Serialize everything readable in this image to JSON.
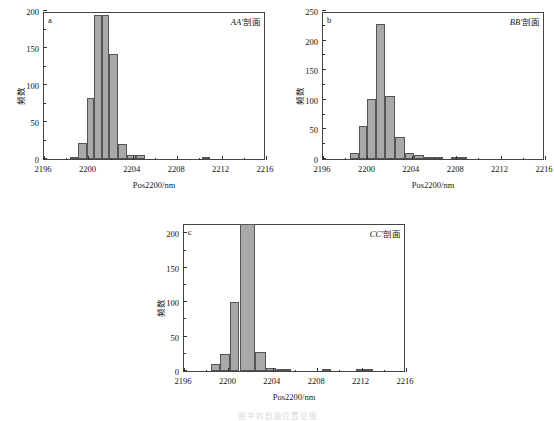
{
  "figure": {
    "axis_title_x": "Pos2200/nm",
    "axis_title_y": "频数",
    "bar_color": "#a9a9a9",
    "bar_edge_color": "#555555",
    "axis_color": "#444444",
    "caption_partial": "图 中 的 剖 面 位 置 见 图"
  },
  "chart_data": [
    {
      "id": "a",
      "type": "bar",
      "panel_letter": "a",
      "title": "AA′剖面",
      "title_italic": "AA′",
      "title_rest": "剖面",
      "xlabel": "Pos2200/nm",
      "ylabel": "频数",
      "xlim": [
        2196,
        2216
      ],
      "ylim": [
        0,
        200
      ],
      "xticks": [
        2196,
        2200,
        2204,
        2208,
        2212,
        2216
      ],
      "xtick_labels": [
        "2196",
        "2200",
        "2204",
        "2208",
        "2212",
        "2216"
      ],
      "yticks": [
        0,
        50,
        100,
        150,
        200
      ],
      "ytick_labels": [
        "0",
        "50",
        "100",
        "150",
        "200"
      ],
      "bin_width": 0.5,
      "grid": false,
      "bins": [
        {
          "x": 2198.5,
          "value": 1
        },
        {
          "x": 2199.5,
          "value": 21
        },
        {
          "x": 2200.0,
          "value": 82
        },
        {
          "x": 2200.5,
          "value": 194
        },
        {
          "x": 2201.0,
          "value": 194
        },
        {
          "x": 2201.5,
          "value": 142
        },
        {
          "x": 2202.5,
          "value": 20
        },
        {
          "x": 2203.5,
          "value": 5
        },
        {
          "x": 2204.0,
          "value": 5
        },
        {
          "x": 2210.5,
          "value": 1
        }
      ],
      "bars_px": [
        {
          "x0": 2198.3,
          "x1": 2199.1,
          "value": 1
        },
        {
          "x0": 2199.1,
          "x1": 2199.9,
          "value": 21
        },
        {
          "x0": 2199.9,
          "x1": 2200.5,
          "value": 82
        },
        {
          "x0": 2200.5,
          "x1": 2201.2,
          "value": 194
        },
        {
          "x0": 2201.2,
          "x1": 2201.9,
          "value": 194
        },
        {
          "x0": 2201.9,
          "x1": 2202.7,
          "value": 142
        },
        {
          "x0": 2202.7,
          "x1": 2203.5,
          "value": 20
        },
        {
          "x0": 2203.5,
          "x1": 2204.3,
          "value": 5
        },
        {
          "x0": 2204.3,
          "x1": 2205.1,
          "value": 5
        },
        {
          "x0": 2210.2,
          "x1": 2211.0,
          "value": 1
        }
      ]
    },
    {
      "id": "b",
      "type": "bar",
      "panel_letter": "b",
      "title": "BB′剖面",
      "title_italic": "BB′",
      "title_rest": "剖面",
      "xlabel": "Pos2200/nm",
      "ylabel": "频数",
      "xlim": [
        2196,
        2216
      ],
      "ylim": [
        0,
        250
      ],
      "xticks": [
        2196,
        2200,
        2204,
        2208,
        2212,
        2216
      ],
      "xtick_labels": [
        "2196",
        "2200",
        "2204",
        "2208",
        "2212",
        "2216"
      ],
      "yticks": [
        0,
        50,
        100,
        150,
        200,
        250
      ],
      "ytick_labels": [
        "0",
        "50",
        "100",
        "150",
        "200",
        "250"
      ],
      "bin_width": 0.5,
      "grid": false,
      "bars_px": [
        {
          "x0": 2198.4,
          "x1": 2199.2,
          "value": 10
        },
        {
          "x0": 2199.2,
          "x1": 2200.0,
          "value": 56
        },
        {
          "x0": 2200.0,
          "x1": 2200.8,
          "value": 102
        },
        {
          "x0": 2200.8,
          "x1": 2201.6,
          "value": 228
        },
        {
          "x0": 2201.6,
          "x1": 2202.5,
          "value": 107
        },
        {
          "x0": 2202.5,
          "x1": 2203.4,
          "value": 37
        },
        {
          "x0": 2203.4,
          "x1": 2204.2,
          "value": 11
        },
        {
          "x0": 2204.2,
          "x1": 2205.1,
          "value": 6
        },
        {
          "x0": 2205.1,
          "x1": 2206.8,
          "value": 2
        },
        {
          "x0": 2207.5,
          "x1": 2208.3,
          "value": 3
        },
        {
          "x0": 2208.3,
          "x1": 2209.0,
          "value": 2
        }
      ]
    },
    {
      "id": "c",
      "type": "bar",
      "panel_letter": "c",
      "title": "CC′剖面",
      "title_italic": "CC′",
      "title_rest": "剖面",
      "xlabel": "Pos2200/nm",
      "ylabel": "频数",
      "xlim": [
        2196,
        2216
      ],
      "ylim": [
        0,
        215
      ],
      "xticks": [
        2196,
        2200,
        2204,
        2208,
        2212,
        2216
      ],
      "xtick_labels": [
        "2196",
        "2200",
        "2204",
        "2208",
        "2212",
        "2216"
      ],
      "yticks": [
        0,
        50,
        100,
        150,
        200
      ],
      "ytick_labels": [
        "0",
        "50",
        "100",
        "150",
        "200"
      ],
      "bin_width": 0.5,
      "grid": false,
      "bars_px": [
        {
          "x0": 2198.4,
          "x1": 2199.2,
          "value": 10
        },
        {
          "x0": 2199.2,
          "x1": 2200.1,
          "value": 24
        },
        {
          "x0": 2200.1,
          "x1": 2201.0,
          "value": 100
        },
        {
          "x0": 2201.0,
          "x1": 2202.4,
          "value": 214
        },
        {
          "x0": 2202.4,
          "x1": 2203.4,
          "value": 27
        },
        {
          "x0": 2203.4,
          "x1": 2204.3,
          "value": 5
        },
        {
          "x0": 2204.3,
          "x1": 2205.6,
          "value": 3
        },
        {
          "x0": 2208.4,
          "x1": 2209.2,
          "value": 1
        },
        {
          "x0": 2211.5,
          "x1": 2213.0,
          "value": 1
        }
      ]
    }
  ]
}
